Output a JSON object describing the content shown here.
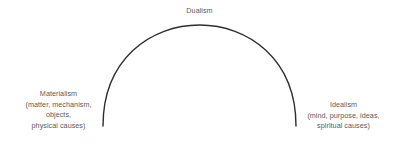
{
  "diagram": {
    "title": "Dualism",
    "type": "spectrum-arc",
    "background_color": "#ffffff",
    "arc": {
      "stroke_color": "#2e2e2e",
      "stroke_width": 1.4,
      "left_endpoint": [
        103,
        126
      ],
      "right_endpoint": [
        296,
        126
      ],
      "apex": [
        200,
        25
      ]
    },
    "text_color": "#5a5a5a",
    "labels": {
      "top": {
        "name": "Dualism",
        "lines": [
          "Dualism"
        ]
      },
      "left": {
        "name": "Materialism",
        "lines": [
          "Materialism",
          "(matter, mechanism,",
          "objects,",
          "physical causes)"
        ]
      },
      "right": {
        "name": "Idealism",
        "lines": [
          "Idealism",
          "(mind, purpose, ideas,",
          "spiritual causes)"
        ]
      }
    }
  }
}
